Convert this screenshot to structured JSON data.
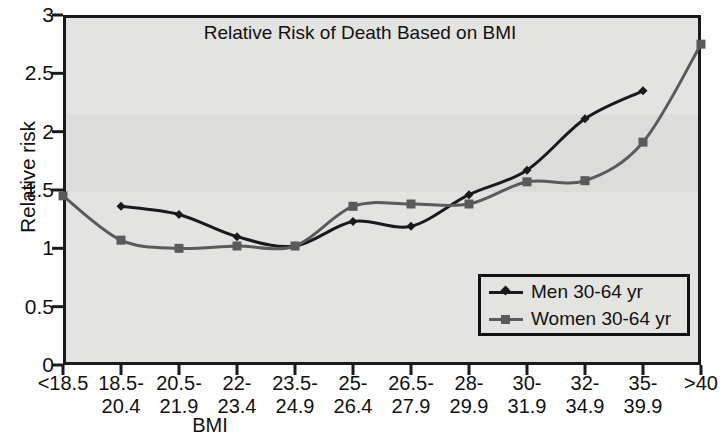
{
  "chart_data": {
    "type": "line",
    "title": "Relative Risk of Death Based on BMI",
    "xlabel": "BMI",
    "ylabel": "Relative risk",
    "categories": [
      "<18.5",
      "18.5-\n20.4",
      "20.5-\n21.9",
      "22-\n23.4",
      "23.5-\n24.9",
      "25-\n26.4",
      "26.5-\n27.9",
      "28-\n29.9",
      "30-\n31.9",
      "32-\n34.9",
      "35-\n39.9",
      ">40"
    ],
    "xtick_labels": [
      "<18.5",
      "18.5-\n20.4",
      "20.5-\n21.9",
      "22-\n23.4",
      "23.5-\n24.9",
      "25-\n26.4",
      "26.5-\n27.9",
      "28-\n29.9",
      "30-\n31.9",
      "32-\n34.9",
      "35-\n39.9",
      ">40"
    ],
    "ytick_labels": [
      "0",
      "0.5",
      "1",
      "1.5",
      "2",
      "2.5",
      "3"
    ],
    "ytick_values": [
      0,
      0.5,
      1,
      1.5,
      2,
      2.5,
      3
    ],
    "ylim": [
      0,
      3
    ],
    "grid": false,
    "legend_position": "bottom-right",
    "series": [
      {
        "name": "Men 30-64 yr",
        "color": "#1a1a1a",
        "marker": "diamond",
        "x": [
          "18.5-\n20.4",
          "20.5-\n21.9",
          "22-\n23.4",
          "23.5-\n24.9",
          "25-\n26.4",
          "26.5-\n27.9",
          "28-\n29.9",
          "30-\n31.9",
          "32-\n34.9",
          "35-\n39.9"
        ],
        "values": [
          1.36,
          1.29,
          1.1,
          1.02,
          1.23,
          1.19,
          1.46,
          1.67,
          2.11,
          2.35
        ]
      },
      {
        "name": "Women 30-64 yr",
        "color": "#5a5a5a",
        "marker": "square",
        "x": [
          "<18.5",
          "18.5-\n20.4",
          "20.5-\n21.9",
          "22-\n23.4",
          "23.5-\n24.9",
          "25-\n26.4",
          "26.5-\n27.9",
          "28-\n29.9",
          "30-\n31.9",
          "32-\n34.9",
          "35-\n39.9",
          ">40"
        ],
        "values": [
          1.45,
          1.07,
          1.0,
          1.02,
          1.02,
          1.36,
          1.38,
          1.38,
          1.57,
          1.58,
          1.91,
          2.75
        ]
      }
    ]
  },
  "legend": {
    "entries": [
      {
        "label": "Men 30-64 yr"
      },
      {
        "label": "Women 30-64 yr"
      }
    ]
  }
}
